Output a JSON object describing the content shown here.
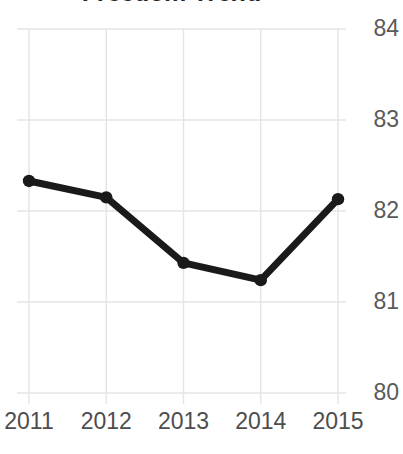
{
  "chart_data": {
    "type": "line",
    "title": "Freedom Trend",
    "xlabel": "",
    "ylabel": "",
    "categories": [
      "2011",
      "2012",
      "2013",
      "2014",
      "2015"
    ],
    "values": [
      82.33,
      82.15,
      81.43,
      81.24,
      82.13
    ],
    "series": [
      {
        "name": "Freedom Trend",
        "values": [
          82.33,
          82.15,
          81.43,
          81.24,
          82.13
        ]
      }
    ],
    "ylim": [
      80,
      84
    ],
    "yticks": [
      "80",
      "81",
      "82",
      "83",
      "84"
    ],
    "ytick_values": [
      80,
      81,
      82,
      83,
      84
    ],
    "xticks": [
      "2011",
      "2012",
      "2013",
      "2014",
      "2015"
    ],
    "grid": true,
    "legend": false,
    "legend_position": "none",
    "marker": "circle",
    "colors": {
      "line": "#1a1a1a",
      "marker": "#1a1a1a",
      "grid": "#e4e4e4",
      "title_text": "#262626",
      "y_tick_text": "#5a5a5a",
      "x_tick_text": "#4d4d4d",
      "background": "#ffffff"
    }
  }
}
